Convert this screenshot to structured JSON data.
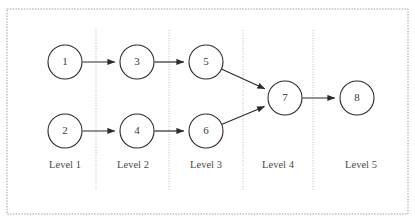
{
  "figure": {
    "kind": "layered-directed-graph",
    "background_color": "#ffffff",
    "frame_color": "#9a9a9a",
    "node_stroke_color": "#2b2b2b",
    "node_fill_color": "#ffffff",
    "edge_color": "#2b2b2b",
    "divider_color": "#b9b9b9"
  },
  "nodes": [
    {
      "id": "1",
      "label": "1",
      "cx": 65,
      "cy": 62,
      "r": 17,
      "level": 1
    },
    {
      "id": "2",
      "label": "2",
      "cx": 65,
      "cy": 131,
      "r": 17,
      "level": 1
    },
    {
      "id": "3",
      "label": "3",
      "cx": 137,
      "cy": 62,
      "r": 17,
      "level": 2
    },
    {
      "id": "4",
      "label": "4",
      "cx": 137,
      "cy": 131,
      "r": 17,
      "level": 2
    },
    {
      "id": "5",
      "label": "5",
      "cx": 206,
      "cy": 62,
      "r": 17,
      "level": 3
    },
    {
      "id": "6",
      "label": "6",
      "cx": 206,
      "cy": 131,
      "r": 17,
      "level": 3
    },
    {
      "id": "7",
      "label": "7",
      "cx": 285,
      "cy": 98,
      "r": 17,
      "level": 4
    },
    {
      "id": "8",
      "label": "8",
      "cx": 357,
      "cy": 98,
      "r": 17,
      "level": 5
    }
  ],
  "edges": [
    {
      "from": "1",
      "to": "3"
    },
    {
      "from": "2",
      "to": "4"
    },
    {
      "from": "3",
      "to": "5"
    },
    {
      "from": "4",
      "to": "6"
    },
    {
      "from": "5",
      "to": "7"
    },
    {
      "from": "6",
      "to": "7"
    },
    {
      "from": "7",
      "to": "8"
    }
  ],
  "dividers": [
    {
      "x": 96,
      "y1": 30,
      "y2": 190
    },
    {
      "x": 169,
      "y1": 30,
      "y2": 190
    },
    {
      "x": 243,
      "y1": 30,
      "y2": 190
    },
    {
      "x": 313,
      "y1": 30,
      "y2": 190
    }
  ],
  "levels": [
    {
      "label": "Level 1",
      "x": 65,
      "y": 166
    },
    {
      "label": "Level 2",
      "x": 133,
      "y": 166
    },
    {
      "label": "Level 3",
      "x": 206,
      "y": 166
    },
    {
      "label": "Level 4",
      "x": 278,
      "y": 166
    },
    {
      "label": "Level 5",
      "x": 361,
      "y": 166
    }
  ],
  "frame": {
    "x": 7,
    "y": 9,
    "width": 401,
    "height": 205
  }
}
